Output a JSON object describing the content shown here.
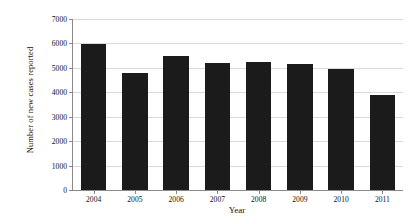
{
  "chart_data": {
    "type": "bar",
    "title": "",
    "xlabel": "Year",
    "ylabel": "Number of new cases reported",
    "categories": [
      "2004",
      "2005",
      "2006",
      "2007",
      "2008",
      "2009",
      "2010",
      "2011"
    ],
    "values": [
      5980,
      4790,
      5480,
      5200,
      5230,
      5140,
      4950,
      3890
    ],
    "ylim": [
      0,
      7000
    ],
    "yticks": [
      0,
      1000,
      2000,
      3000,
      4000,
      5000,
      6000,
      7000
    ],
    "ytick_labels": [
      "0",
      "1000",
      "2000",
      "3000",
      "4000",
      "5000",
      "6000",
      "7000"
    ],
    "grid": "horizontal",
    "legend": "none",
    "bar_color": "#1b1b1b",
    "gridline_color": "#d9d9d9",
    "axis_color": "#8a8a8a",
    "background_color": "#ffffff"
  }
}
